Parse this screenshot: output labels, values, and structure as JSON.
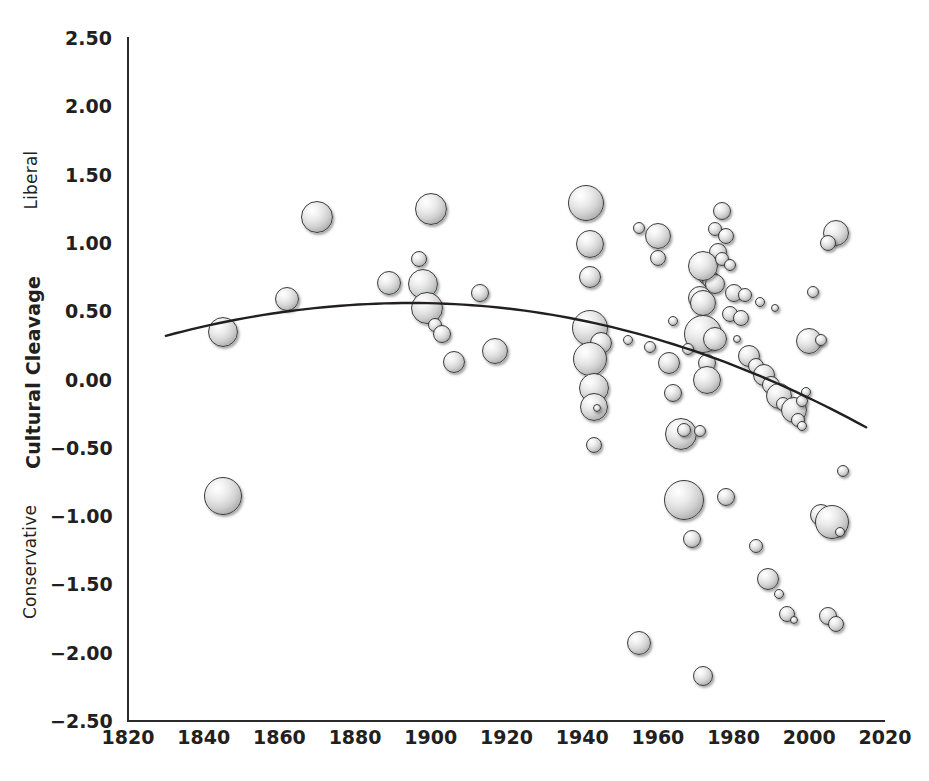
{
  "chart_data": {
    "type": "scatter",
    "title": "",
    "xlabel": "",
    "ylabel": "Cultural Cleavage",
    "ylabel_top": "Liberal",
    "ylabel_bottom": "Conservative",
    "xlim": [
      1820,
      2020
    ],
    "ylim": [
      -2.5,
      2.5
    ],
    "xticks": [
      "1820",
      "1840",
      "1860",
      "1880",
      "1900",
      "1920",
      "1940",
      "1960",
      "1980",
      "2000",
      "2020"
    ],
    "xtick_values": [
      1820,
      1840,
      1860,
      1880,
      1900,
      1920,
      1940,
      1960,
      1980,
      2000,
      2020
    ],
    "yticks": [
      "2.50",
      "2.00",
      "1.50",
      "1.00",
      "0.50",
      "0.00",
      "−0.50",
      "−1.00",
      "−1.50",
      "−2.00",
      "−2.50"
    ],
    "ytick_values": [
      2.5,
      2.0,
      1.5,
      1.0,
      0.5,
      0.0,
      -0.5,
      -1.0,
      -1.5,
      -2.0,
      -2.5
    ],
    "grid": false,
    "legend": "none",
    "marker_style": "3d-sphere-bubble",
    "bubble_size_encodes": "magnitude",
    "series": [
      {
        "name": "Elections",
        "points": [
          {
            "x": 1845,
            "y": -0.85,
            "r": 19
          },
          {
            "x": 1845,
            "y": 0.35,
            "r": 15
          },
          {
            "x": 1862,
            "y": 0.59,
            "r": 12
          },
          {
            "x": 1870,
            "y": 1.19,
            "r": 16
          },
          {
            "x": 1889,
            "y": 0.71,
            "r": 12
          },
          {
            "x": 1897,
            "y": 0.88,
            "r": 8
          },
          {
            "x": 1898,
            "y": 0.7,
            "r": 15
          },
          {
            "x": 1900,
            "y": 1.25,
            "r": 16
          },
          {
            "x": 1899,
            "y": 0.52,
            "r": 16
          },
          {
            "x": 1901,
            "y": 0.4,
            "r": 7
          },
          {
            "x": 1903,
            "y": 0.33,
            "r": 9
          },
          {
            "x": 1906,
            "y": 0.13,
            "r": 11
          },
          {
            "x": 1913,
            "y": 0.63,
            "r": 9
          },
          {
            "x": 1917,
            "y": 0.21,
            "r": 13
          },
          {
            "x": 1941,
            "y": 1.29,
            "r": 18
          },
          {
            "x": 1942,
            "y": 0.99,
            "r": 14
          },
          {
            "x": 1942,
            "y": 0.75,
            "r": 11
          },
          {
            "x": 1942,
            "y": 0.38,
            "r": 18
          },
          {
            "x": 1945,
            "y": 0.27,
            "r": 11
          },
          {
            "x": 1942,
            "y": 0.15,
            "r": 17
          },
          {
            "x": 1943,
            "y": -0.06,
            "r": 15
          },
          {
            "x": 1943,
            "y": -0.2,
            "r": 14
          },
          {
            "x": 1944,
            "y": -0.21,
            "r": 4
          },
          {
            "x": 1943,
            "y": -0.48,
            "r": 8
          },
          {
            "x": 1955,
            "y": -1.93,
            "r": 12
          },
          {
            "x": 1955,
            "y": 1.11,
            "r": 6
          },
          {
            "x": 1960,
            "y": 1.05,
            "r": 13
          },
          {
            "x": 1960,
            "y": 0.89,
            "r": 8
          },
          {
            "x": 1958,
            "y": 0.24,
            "r": 6
          },
          {
            "x": 1963,
            "y": 0.12,
            "r": 11
          },
          {
            "x": 1964,
            "y": -0.1,
            "r": 9
          },
          {
            "x": 1966,
            "y": -0.4,
            "r": 16
          },
          {
            "x": 1967,
            "y": -0.37,
            "r": 7
          },
          {
            "x": 1967,
            "y": -0.88,
            "r": 20
          },
          {
            "x": 1969,
            "y": -1.17,
            "r": 9
          },
          {
            "x": 1972,
            "y": -2.17,
            "r": 10
          },
          {
            "x": 1977,
            "y": 1.23,
            "r": 9
          },
          {
            "x": 1975,
            "y": 1.1,
            "r": 7
          },
          {
            "x": 1976,
            "y": 0.93,
            "r": 9
          },
          {
            "x": 1978,
            "y": 1.05,
            "r": 8
          },
          {
            "x": 1973,
            "y": 0.76,
            "r": 9
          },
          {
            "x": 1974,
            "y": 0.73,
            "r": 9
          },
          {
            "x": 1975,
            "y": 0.7,
            "r": 10
          },
          {
            "x": 1972,
            "y": 0.83,
            "r": 15
          },
          {
            "x": 1971,
            "y": 0.6,
            "r": 12
          },
          {
            "x": 1972,
            "y": 0.56,
            "r": 13
          },
          {
            "x": 1972,
            "y": 0.33,
            "r": 19
          },
          {
            "x": 1975,
            "y": 0.3,
            "r": 12
          },
          {
            "x": 1973,
            "y": 0.12,
            "r": 9
          },
          {
            "x": 1973,
            "y": 0.0,
            "r": 14
          },
          {
            "x": 1980,
            "y": 0.63,
            "r": 9
          },
          {
            "x": 1979,
            "y": 0.48,
            "r": 8
          },
          {
            "x": 1982,
            "y": 0.45,
            "r": 8
          },
          {
            "x": 1983,
            "y": 0.62,
            "r": 7
          },
          {
            "x": 1987,
            "y": 0.57,
            "r": 5
          },
          {
            "x": 1981,
            "y": 0.3,
            "r": 4
          },
          {
            "x": 1984,
            "y": 0.17,
            "r": 11
          },
          {
            "x": 1986,
            "y": 0.1,
            "r": 8
          },
          {
            "x": 1988,
            "y": 0.03,
            "r": 11
          },
          {
            "x": 1990,
            "y": -0.04,
            "r": 9
          },
          {
            "x": 1992,
            "y": -0.12,
            "r": 13
          },
          {
            "x": 1993,
            "y": -0.18,
            "r": 7
          },
          {
            "x": 1996,
            "y": -0.22,
            "r": 13
          },
          {
            "x": 1997,
            "y": -0.3,
            "r": 7
          },
          {
            "x": 1998,
            "y": -0.16,
            "r": 6
          },
          {
            "x": 2000,
            "y": 0.28,
            "r": 13
          },
          {
            "x": 2003,
            "y": 0.29,
            "r": 6
          },
          {
            "x": 2001,
            "y": 0.64,
            "r": 6
          },
          {
            "x": 2007,
            "y": 1.07,
            "r": 13
          },
          {
            "x": 2005,
            "y": 1.0,
            "r": 8
          },
          {
            "x": 1978,
            "y": -0.86,
            "r": 9
          },
          {
            "x": 1986,
            "y": -1.22,
            "r": 7
          },
          {
            "x": 1989,
            "y": -1.46,
            "r": 11
          },
          {
            "x": 1992,
            "y": -1.57,
            "r": 5
          },
          {
            "x": 1994,
            "y": -1.72,
            "r": 8
          },
          {
            "x": 1996,
            "y": -1.76,
            "r": 4
          },
          {
            "x": 2003,
            "y": -0.99,
            "r": 11
          },
          {
            "x": 2006,
            "y": -1.04,
            "r": 17
          },
          {
            "x": 2008,
            "y": -1.12,
            "r": 5
          },
          {
            "x": 2005,
            "y": -1.73,
            "r": 9
          },
          {
            "x": 2007,
            "y": -1.79,
            "r": 8
          },
          {
            "x": 2009,
            "y": -0.67,
            "r": 6
          },
          {
            "x": 1971,
            "y": -0.38,
            "r": 6
          },
          {
            "x": 1998,
            "y": -0.34,
            "r": 5
          },
          {
            "x": 1999,
            "y": -0.09,
            "r": 5
          },
          {
            "x": 1968,
            "y": 0.22,
            "r": 6
          },
          {
            "x": 1964,
            "y": 0.43,
            "r": 5
          },
          {
            "x": 1952,
            "y": 0.29,
            "r": 5
          },
          {
            "x": 1977,
            "y": 0.88,
            "r": 7
          },
          {
            "x": 1979,
            "y": 0.84,
            "r": 6
          },
          {
            "x": 1991,
            "y": 0.52,
            "r": 4
          }
        ]
      }
    ],
    "trendline": {
      "shape": "quadratic",
      "x_start": 1830,
      "x_end": 2015,
      "y_start": 0.32,
      "y_peak": 0.56,
      "x_peak": 1895,
      "y_end": -0.35,
      "color": "#231f20"
    }
  },
  "colors": {
    "axis": "#2a2a2a",
    "text": "#231f20",
    "bubble_fill_light": "#f4f4f4",
    "bubble_fill_dark": "#8d8d8d",
    "bubble_stroke": "#3b3b3b",
    "background": "#ffffff"
  }
}
